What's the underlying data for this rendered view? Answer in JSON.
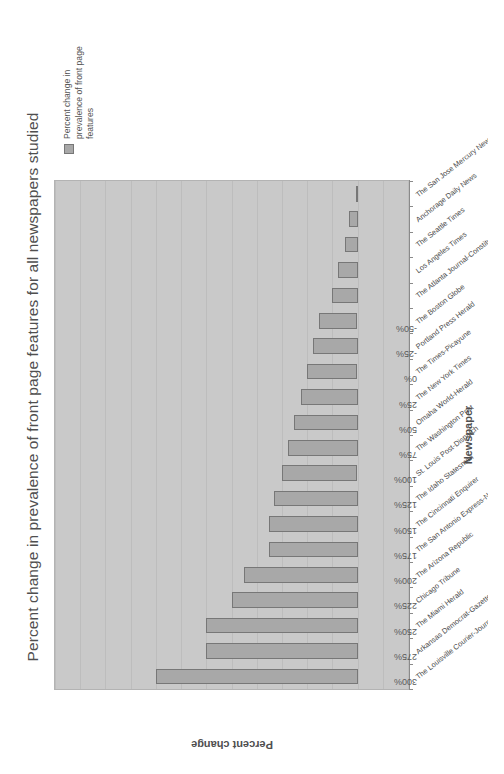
{
  "chart_data": {
    "type": "bar",
    "orientation": "vertical",
    "title": "Percent change in prevalence of front page features for all newspapers studied",
    "xlabel": "Newspaper",
    "ylabel": "Percent change",
    "ylim": [
      -50,
      300
    ],
    "ytick_labels": [
      "300%",
      "275%",
      "250%",
      "225%",
      "200%",
      "175%",
      "150%",
      "125%",
      "100%",
      "75%",
      "50%",
      "25%",
      "0%",
      "-25%",
      "-50%"
    ],
    "ytick_values": [
      300,
      275,
      250,
      225,
      200,
      175,
      150,
      125,
      100,
      75,
      50,
      25,
      0,
      -25,
      -50
    ],
    "grid": true,
    "legend_position": "right",
    "legend": [
      "Percent change in prevalence of front page features"
    ],
    "categories": [
      "The Louisville Courier-Journal",
      "Arkansas Democrat-Gazette",
      "The Miami Herald",
      "Chicago Tribune",
      "The Arizona Republic",
      "The San Antonio Express-News",
      "The Cincinnati Enquirer",
      "The Idaho Statesman",
      "St. Louis Post-Dispatch",
      "The Washington Post",
      "Omaha World-Herald",
      "The New York Times",
      "The Times-Picayune",
      "Portland Press Herald",
      "The Boston Globe",
      "The Atlanta Journal-Constitution",
      "Los Angeles Times",
      "The Seattle Times",
      "Anchorage Daily News",
      "The San Jose Mercury News"
    ],
    "values": [
      200,
      150,
      150,
      125,
      113,
      88,
      88,
      83,
      75,
      69,
      63,
      56,
      50,
      44,
      38,
      25,
      19,
      13,
      9,
      2
    ]
  },
  "legend": {
    "swatch_name": "legend-swatch",
    "label": "Percent change in prevalence of front page features"
  }
}
